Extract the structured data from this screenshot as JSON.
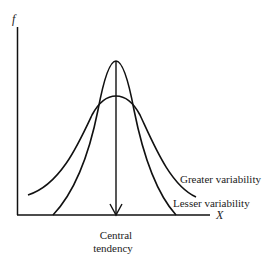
{
  "diagram": {
    "y_axis_label": "f",
    "x_axis_label": "X",
    "curves": [
      {
        "name": "Lesser variability",
        "label": "Lesser variability"
      },
      {
        "name": "Greater variability",
        "label": "Greater variability"
      }
    ],
    "central_line_label_line1": "Central",
    "central_line_label_line2": "tendency"
  }
}
